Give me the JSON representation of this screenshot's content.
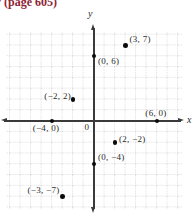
{
  "header": {
    "text": "y (page 605)"
  },
  "graph": {
    "origin_label": "0"
  },
  "colors": {
    "header_text": "#8e2434",
    "axis": "#3a3a3a",
    "grid_line": "#c6c6c6",
    "point": "#0b0b0b"
  },
  "chart_data": {
    "type": "scatter",
    "title": "",
    "xlabel": "x",
    "ylabel": "y",
    "xlim": [
      -8,
      8
    ],
    "ylim": [
      -8,
      8
    ],
    "grid": true,
    "origin_label": "0",
    "points": [
      {
        "x": 3,
        "y": 7,
        "label": "(3, 7)",
        "label_anchor": "start",
        "label_dx": 4,
        "label_dy": -10
      },
      {
        "x": 0,
        "y": 6,
        "label": "(0, 6)",
        "label_anchor": "start",
        "label_dx": 4,
        "label_dy": 1
      },
      {
        "x": -2,
        "y": 2,
        "label": "(−2, 2)",
        "label_anchor": "end",
        "label_dx": -2,
        "label_dy": -7
      },
      {
        "x": -4,
        "y": 0,
        "label": "(−4, 0)",
        "label_anchor": "middle",
        "label_dx": -6,
        "label_dy": 3
      },
      {
        "x": 6,
        "y": 0,
        "label": "(6, 0)",
        "label_anchor": "middle",
        "label_dx": -1,
        "label_dy": -12
      },
      {
        "x": 2,
        "y": -2,
        "label": "(2, −2)",
        "label_anchor": "start",
        "label_dx": 4,
        "label_dy": -8
      },
      {
        "x": 0,
        "y": -4,
        "label": "(0, −4)",
        "label_anchor": "start",
        "label_dx": 4,
        "label_dy": -11
      },
      {
        "x": -3,
        "y": -7,
        "label": "(−3, −7)",
        "label_anchor": "end",
        "label_dx": -3,
        "label_dy": -11
      }
    ]
  }
}
